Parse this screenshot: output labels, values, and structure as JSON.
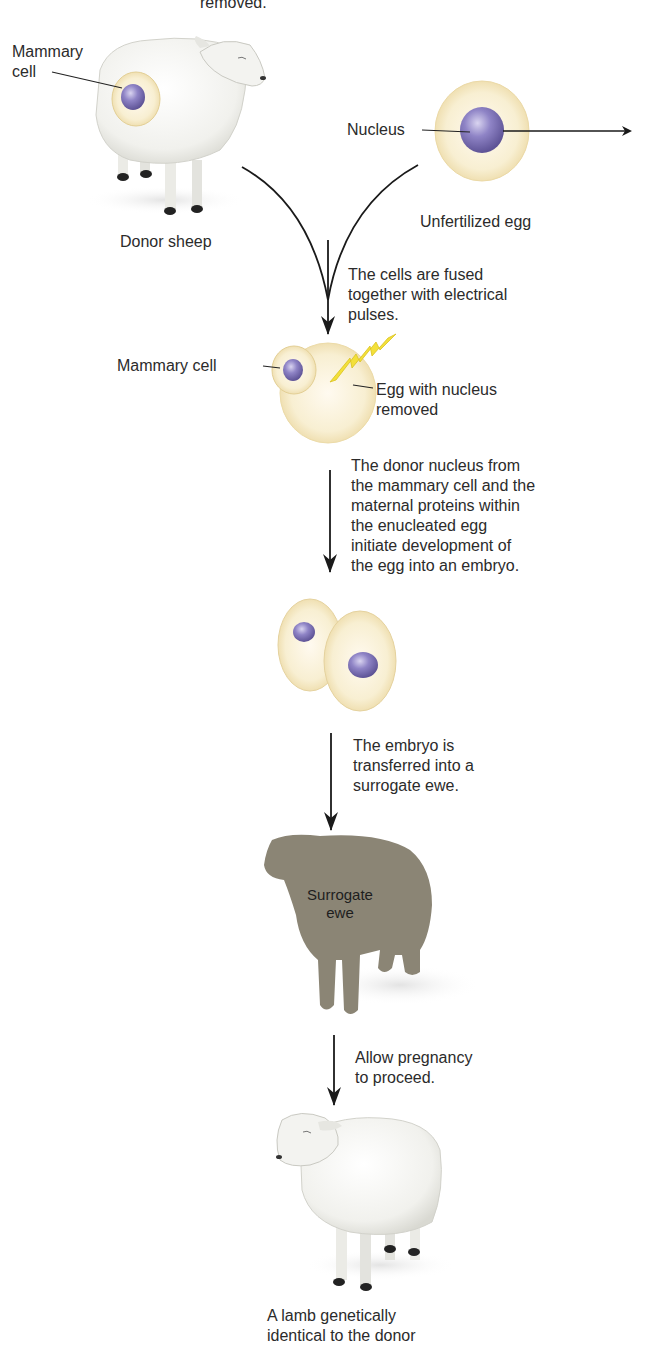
{
  "colors": {
    "nucleus": "#8a7fc0",
    "cytoplasm": "#f7ecc8",
    "cell_edge": "#e8d9a8",
    "wool": "#f4f4f1",
    "surrogate": "#8b8575",
    "spark": "#f3e03a",
    "arrow": "#1a1a1a"
  },
  "labels": {
    "top_cut": "removed.",
    "mammary_cell_top": "Mammary\ncell",
    "donor_sheep": "Donor sheep",
    "nucleus": "Nucleus",
    "unfertilized_egg": "Unfertilized egg",
    "mammary_cell_fused": "Mammary cell",
    "egg_removed": "Egg with nucleus\nremoved",
    "surrogate_ewe": "Surrogate\newe",
    "result_lamb": "A lamb genetically\nidentical to the donor"
  },
  "steps": [
    {
      "text": "The cells are fused\ntogether with electrical\npulses."
    },
    {
      "text": "The donor nucleus from\nthe mammary cell and the\nmaternal proteins within\nthe enucleated egg\ninitiate development of\nthe egg into an embryo."
    },
    {
      "text": "The embryo is\ntransferred into a\nsurrogate ewe."
    },
    {
      "text": "Allow pregnancy\nto proceed."
    }
  ]
}
